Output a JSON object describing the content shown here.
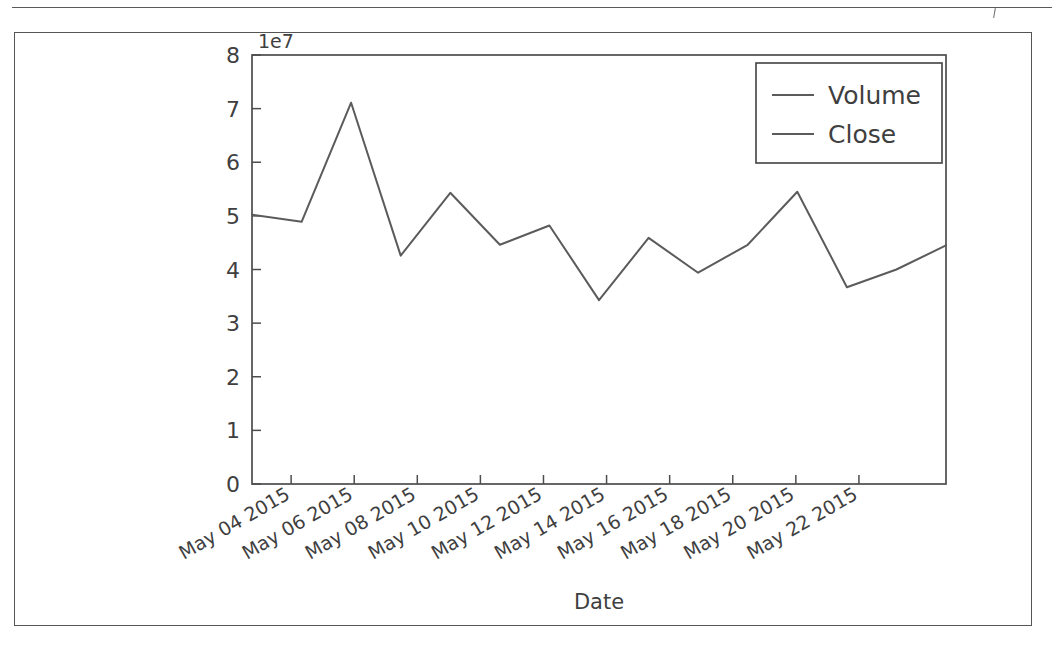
{
  "figure": {
    "frame_color": "#555555",
    "background": "#ffffff"
  },
  "chart_data": {
    "type": "line",
    "title": "",
    "xlabel": "Date",
    "ylabel": "",
    "y_offset_label": "1e7",
    "y_offset_multiplier": 10000000,
    "ylim": [
      0,
      80000000
    ],
    "xlim": [
      "May 03 2015",
      "May 23 2015"
    ],
    "grid": false,
    "legend_position": "upper right",
    "y_ticks": [
      0,
      1,
      2,
      3,
      4,
      5,
      6,
      7,
      8
    ],
    "y_tick_labels": [
      "0",
      "1",
      "2",
      "3",
      "4",
      "5",
      "6",
      "7",
      "8"
    ],
    "x_tick_labels": [
      "May 04 2015",
      "May 06 2015",
      "May 08 2015",
      "May 10 2015",
      "May 12 2015",
      "May 14 2015",
      "May 16 2015",
      "May 18 2015",
      "May 20 2015",
      "May 22 2015"
    ],
    "x_tick_rotation_deg": 30,
    "legend_entries": [
      "Volume",
      "Close"
    ],
    "series": [
      {
        "name": "Volume",
        "color": "#5b5b5b",
        "x": [
          "May 04 2015",
          "May 05 2015",
          "May 06 2015",
          "May 07 2015",
          "May 08 2015",
          "May 11 2015",
          "May 12 2015",
          "May 13 2015",
          "May 14 2015",
          "May 15 2015",
          "May 18 2015",
          "May 19 2015",
          "May 20 2015",
          "May 21 2015",
          "May 22 2015"
        ],
        "values": [
          50200000,
          48900000,
          71100000,
          42600000,
          54300000,
          44600000,
          48200000,
          34300000,
          45900000,
          39400000,
          44600000,
          54500000,
          36700000,
          40000000,
          44500000
        ]
      },
      {
        "name": "Close",
        "color": "#5b5b5b",
        "values": []
      }
    ]
  },
  "axis_label": {
    "x": "Date"
  }
}
